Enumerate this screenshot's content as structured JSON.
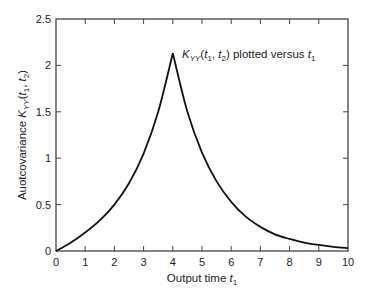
{
  "chart_data": {
    "type": "line",
    "title": "",
    "xlabel": "Output time t1",
    "xlabel_parts": {
      "main": "Output time ",
      "var": "t",
      "sub": "1"
    },
    "ylabel": "Auotcovariance K_YY(t1, t2)",
    "ylabel_parts": {
      "main": "Auotcovariance ",
      "var": "K",
      "sub": "YY",
      "args": [
        "(",
        "t",
        "1",
        ", ",
        "t",
        "2",
        ")"
      ]
    },
    "annotation": "K_YY(t1, t2) plotted versus t1",
    "annotation_parts": {
      "var": "K",
      "sub": "YY",
      "rest": " plotted versus "
    },
    "xlim": [
      0,
      10
    ],
    "ylim": [
      0,
      2.5
    ],
    "x_ticks": [
      "0",
      "1",
      "2",
      "3",
      "4",
      "5",
      "6",
      "7",
      "8",
      "9",
      "10"
    ],
    "y_ticks": [
      "0",
      "0.5",
      "1",
      "1.5",
      "2",
      "2.5"
    ],
    "grid": false,
    "legend": null,
    "series": [
      {
        "name": "K_YY(t1, t2) with t2 = 4",
        "color": "#111111",
        "x": [
          0,
          0.5,
          1,
          1.5,
          2,
          2.5,
          3,
          3.5,
          4,
          4.5,
          5,
          5.5,
          6,
          6.5,
          7,
          7.5,
          8,
          8.5,
          9,
          9.5,
          10
        ],
        "y": [
          0,
          0.09,
          0.2,
          0.33,
          0.5,
          0.73,
          1.05,
          1.5,
          2.13,
          1.5,
          1.06,
          0.75,
          0.53,
          0.37,
          0.26,
          0.18,
          0.13,
          0.09,
          0.065,
          0.045,
          0.03
        ]
      }
    ],
    "peak": {
      "x": 4,
      "y": 2.13
    }
  }
}
